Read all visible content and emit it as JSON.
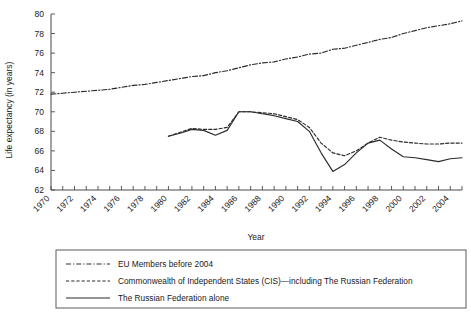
{
  "chart_data": {
    "type": "line",
    "title": "",
    "xlabel": "Year",
    "ylabel": "Life expectancy (in years)",
    "xlim": [
      1970,
      2005
    ],
    "ylim": [
      62,
      80
    ],
    "grid": false,
    "legend_position": "below",
    "y_ticks": [
      62,
      64,
      66,
      68,
      70,
      72,
      74,
      76,
      78,
      80
    ],
    "x_ticks": [
      1970,
      1971,
      1972,
      1973,
      1974,
      1975,
      1976,
      1977,
      1978,
      1979,
      1980,
      1981,
      1982,
      1983,
      1984,
      1985,
      1986,
      1987,
      1988,
      1989,
      1990,
      1991,
      1992,
      1993,
      1994,
      1995,
      1996,
      1997,
      1998,
      1999,
      2000,
      2001,
      2002,
      2003,
      2004,
      2005
    ],
    "x_tick_labels": [
      "1970",
      "",
      "1972",
      "",
      "1974",
      "",
      "1976",
      "",
      "1978",
      "",
      "1980",
      "",
      "1982",
      "",
      "1984",
      "",
      "1986",
      "",
      "1988",
      "",
      "1990",
      "",
      "1992",
      "",
      "1994",
      "",
      "1996",
      "",
      "1998",
      "",
      "2000",
      "",
      "2002",
      "",
      "2004",
      ""
    ],
    "series": [
      {
        "name": "EU Members before 2004",
        "style": "dash-dot",
        "x": [
          1970,
          1971,
          1972,
          1973,
          1974,
          1975,
          1976,
          1977,
          1978,
          1979,
          1980,
          1981,
          1982,
          1983,
          1984,
          1985,
          1986,
          1987,
          1988,
          1989,
          1990,
          1991,
          1992,
          1993,
          1994,
          1995,
          1996,
          1997,
          1998,
          1999,
          2000,
          2001,
          2002,
          2003,
          2004,
          2005
        ],
        "values": [
          71.8,
          71.9,
          72.0,
          72.1,
          72.2,
          72.3,
          72.5,
          72.7,
          72.8,
          73.0,
          73.2,
          73.4,
          73.6,
          73.7,
          74.0,
          74.2,
          74.5,
          74.8,
          75.0,
          75.1,
          75.4,
          75.6,
          75.9,
          76.0,
          76.4,
          76.5,
          76.8,
          77.1,
          77.4,
          77.6,
          78.0,
          78.3,
          78.6,
          78.8,
          79.0,
          79.3
        ]
      },
      {
        "name": "Commonwealth of Independent States (CIS)—including The Russian Federation",
        "style": "dashed",
        "x": [
          1980,
          1981,
          1982,
          1983,
          1984,
          1985,
          1986,
          1987,
          1988,
          1989,
          1990,
          1991,
          1992,
          1993,
          1994,
          1995,
          1996,
          1997,
          1998,
          1999,
          2000,
          2001,
          2002,
          2003,
          2004,
          2005
        ],
        "values": [
          67.5,
          67.9,
          68.3,
          68.2,
          68.2,
          68.4,
          70.0,
          70.0,
          69.9,
          69.8,
          69.5,
          69.2,
          68.4,
          66.8,
          65.8,
          65.5,
          66.0,
          66.8,
          67.4,
          67.1,
          66.9,
          66.8,
          66.7,
          66.7,
          66.8,
          66.8
        ]
      },
      {
        "name": "The Russian Federation alone",
        "style": "solid",
        "x": [
          1980,
          1981,
          1982,
          1983,
          1984,
          1985,
          1986,
          1987,
          1988,
          1989,
          1990,
          1991,
          1992,
          1993,
          1994,
          1995,
          1996,
          1997,
          1998,
          1999,
          2000,
          2001,
          2002,
          2003,
          2004,
          2005
        ],
        "values": [
          67.5,
          67.8,
          68.2,
          68.1,
          67.6,
          68.1,
          70.0,
          70.0,
          69.8,
          69.6,
          69.3,
          69.0,
          68.0,
          65.8,
          63.9,
          64.6,
          65.8,
          66.8,
          67.1,
          66.2,
          65.4,
          65.3,
          65.1,
          64.9,
          65.2,
          65.3
        ]
      }
    ]
  },
  "legend": {
    "entries": [
      {
        "label": "EU Members before 2004",
        "style": "dash-dot"
      },
      {
        "label": "Commonwealth of Independent States (CIS)—including The Russian Federation",
        "style": "dashed"
      },
      {
        "label": "The Russian Federation alone",
        "style": "solid"
      }
    ]
  },
  "colors": {
    "line": "#2b2b2b",
    "axis": "#4a4a4a",
    "text": "#1a1a1a",
    "background": "#ffffff"
  }
}
